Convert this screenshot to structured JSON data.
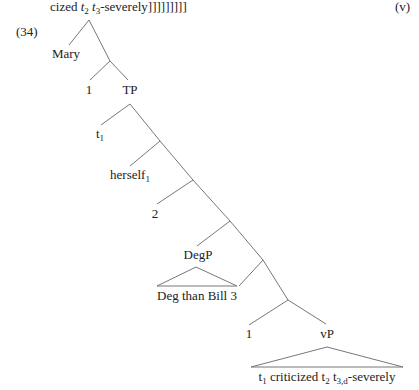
{
  "header": {
    "continuation_prefix": "cized ",
    "t2_base": "t",
    "t2_sub": "2",
    "t3_base": "t",
    "t3_sub": "3",
    "continuation_suffix": "-severely]]]]]]]]]",
    "example_marker": "(v)"
  },
  "example": {
    "number": "(34)",
    "tree": {
      "nodes": {
        "mary": "Mary",
        "one_a": "1",
        "tp": "TP",
        "t1_base": "t",
        "t1_sub": "1",
        "herself_base": "herself",
        "herself_sub": "1",
        "two": "2",
        "degp": "DegP",
        "degp_content": "Deg than Bill 3",
        "one_b": "1",
        "vp": "vP",
        "vp_t1_base": "t",
        "vp_t1_sub": "1",
        "vp_mid": " criticized ",
        "vp_t2_base": "t",
        "vp_t2_sub": "2",
        "vp_t3_base": " t",
        "vp_t3_sub": "3,d",
        "vp_end": "-severely"
      }
    }
  }
}
